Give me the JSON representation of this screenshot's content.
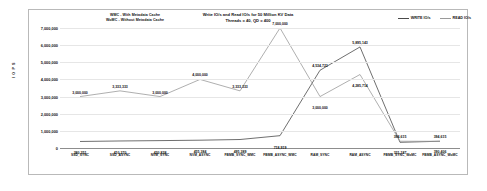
{
  "chart_data": {
    "type": "line",
    "title": "Write IO/s and Read IO/s for 50 Million KV Data",
    "subtitle": "Threads = 40, QD = 400",
    "xlabel": "",
    "ylabel": "I O P S",
    "ylim": [
      0,
      7000000
    ],
    "grid": true,
    "legend_position": "top-right",
    "categories": [
      "SSD_SYNC",
      "SSD_ASYNC",
      "NVM_SYNC",
      "NVM_ASYNC",
      "FBMB_SYNC_WMC",
      "FBMB_ASYNC_WMC",
      "RAM_SYNC",
      "RAM_ASYNC",
      "FBMB_SYNC_WoMC",
      "FBMB_ASYNC_WoMC"
    ],
    "yticks": [
      "7,000,000",
      "6,000,000",
      "5,000,000",
      "4,000,000",
      "3,000,000",
      "2,000,000",
      "1,000,000",
      "0"
    ],
    "ytick_values": [
      7000000,
      6000000,
      5000000,
      4000000,
      3000000,
      2000000,
      1000000,
      0
    ],
    "series": [
      {
        "name": "WRITE IO/s",
        "color": "#4a4a4a",
        "values": [
          380351,
          410270,
          430838,
          455384,
          495389,
          718919,
          4534723,
          5895143,
          331187,
          394615
        ],
        "labels": [
          "380,351",
          "410,270",
          "430,838",
          "455,384",
          "495,389",
          "718,919",
          "4,534,723",
          "5,895,143",
          "331,187",
          "394,615"
        ]
      },
      {
        "name": "READ IO/s",
        "color": "#9a9a9a",
        "values": [
          3000000,
          3333333,
          3000000,
          4000000,
          3333333,
          7000000,
          3000000,
          4285714,
          394615,
          390406
        ],
        "labels": [
          "3,000,000",
          "3,333,333",
          "3,000,000",
          "4,000,000",
          "3,333,333",
          "7,000,000",
          "3,000,000",
          "4,285,714",
          "394,615",
          "390,406"
        ]
      }
    ]
  },
  "annotations": {
    "abbrev_line1": "WMC - With Metadata Cache",
    "abbrev_line2": "WoMC - Without Metadata Cache"
  }
}
